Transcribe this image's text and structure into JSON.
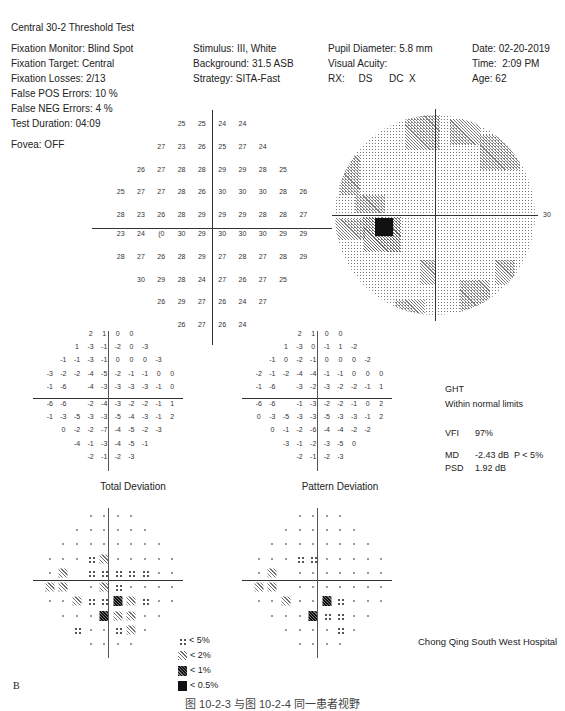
{
  "header": {
    "title": "Central 30-2 Threshold Test",
    "col1": [
      "Fixation Monitor: Blind Spot",
      "Fixation Target: Central",
      "Fixation Losses: 2/13",
      "False POS Errors:  10 %",
      "False NEG Errors:   4 %",
      "Test Duration: 04:09"
    ],
    "col2": [
      "Stimulus: III, White",
      "Background: 31.5 ASB",
      "Strategy: SITA-Fast"
    ],
    "col3": [
      "Pupil Diameter: 5.8 mm",
      "Visual Acuity:",
      "RX:     DS      DC  X"
    ],
    "col4": [
      "Date: 02-20-2019",
      "Time:  2:09 PM",
      "Age: 62"
    ],
    "fovea": "Fovea: OFF"
  },
  "threshold_plot": {
    "axis_label_left": "30",
    "axis_label_right": "30",
    "rows": [
      [
        "",
        "",
        "",
        "25",
        "25",
        "24",
        "24",
        "",
        "",
        ""
      ],
      [
        "",
        "",
        "27",
        "23",
        "26",
        "25",
        "27",
        "24",
        "",
        ""
      ],
      [
        "",
        "26",
        "27",
        "28",
        "28",
        "29",
        "29",
        "28",
        "25",
        ""
      ],
      [
        "25",
        "27",
        "27",
        "28",
        "26",
        "30",
        "30",
        "30",
        "28",
        "26"
      ],
      [
        "28",
        "23",
        "26",
        "28",
        "29",
        "29",
        "29",
        "28",
        "28",
        "27"
      ],
      [
        "23",
        "24",
        "(0",
        "30",
        "29",
        "30",
        "30",
        "30",
        "29",
        "29"
      ],
      [
        "28",
        "27",
        "26",
        "28",
        "29",
        "27",
        "28",
        "27",
        "28",
        "29"
      ],
      [
        "",
        "30",
        "29",
        "28",
        "24",
        "27",
        "26",
        "27",
        "25",
        ""
      ],
      [
        "",
        "",
        "26",
        "29",
        "27",
        "26",
        "24",
        "27",
        "",
        ""
      ],
      [
        "",
        "",
        "",
        "26",
        "27",
        "26",
        "24",
        "",
        "",
        ""
      ]
    ]
  },
  "total_deviation": {
    "title": "Total Deviation",
    "rows": [
      [
        "",
        "",
        "",
        "2",
        "1",
        "0",
        "0",
        "",
        "",
        ""
      ],
      [
        "",
        "",
        "1",
        "-3",
        "-1",
        "-2",
        "0",
        "-3",
        "",
        ""
      ],
      [
        "",
        "-1",
        "-1",
        "-3",
        "-1",
        "0",
        "0",
        "0",
        "-3",
        ""
      ],
      [
        "-3",
        "-2",
        "-2",
        "-4",
        "-5",
        "-2",
        "-1",
        "-1",
        "0",
        "0"
      ],
      [
        "-1",
        "-6",
        "",
        "-4",
        "-3",
        "-3",
        "-3",
        "-3",
        "-1",
        "0"
      ],
      [
        "-6",
        "-6",
        "",
        "-2",
        "-4",
        "-3",
        "-2",
        "-2",
        "-1",
        "1"
      ],
      [
        "-1",
        "-3",
        "-5",
        "-3",
        "-3",
        "-5",
        "-4",
        "-3",
        "-1",
        "2"
      ],
      [
        "",
        "0",
        "-2",
        "-2",
        "-7",
        "-4",
        "-5",
        "-2",
        "-3",
        ""
      ],
      [
        "",
        "",
        "-4",
        "-1",
        "-3",
        "-4",
        "-5",
        "-1",
        "",
        ""
      ],
      [
        "",
        "",
        "",
        "-2",
        "-1",
        "-2",
        "-3",
        "",
        "",
        ""
      ]
    ],
    "prob_rows": [
      [
        "",
        "",
        "",
        "dot",
        "dot",
        "dot",
        "dot",
        "",
        "",
        ""
      ],
      [
        "",
        "",
        "dot",
        "dot",
        "dot",
        "dot",
        "dot",
        "dot",
        "",
        ""
      ],
      [
        "",
        "dot",
        "dot",
        "dot",
        "dot",
        "dot",
        "dot",
        "dot",
        "dot",
        ""
      ],
      [
        "dot",
        "dot",
        "dot",
        "p5",
        "p2",
        "dot",
        "dot",
        "dot",
        "dot",
        "dot"
      ],
      [
        "dot",
        "p2",
        "",
        "p5",
        "p5",
        "p5",
        "p5",
        "p5",
        "dot",
        "dot"
      ],
      [
        "p2",
        "p2",
        "",
        "dot",
        "p2",
        "p5",
        "dot",
        "dot",
        "dot",
        "dot"
      ],
      [
        "dot",
        "dot",
        "p2",
        "p5",
        "p5",
        "p1",
        "p2",
        "p5",
        "dot",
        "dot"
      ],
      [
        "",
        "dot",
        "dot",
        "dot",
        "p1",
        "p2",
        "p2",
        "dot",
        "dot",
        ""
      ],
      [
        "",
        "",
        "p5",
        "dot",
        "dot",
        "p5",
        "p2",
        "dot",
        "",
        ""
      ],
      [
        "",
        "",
        "",
        "dot",
        "dot",
        "dot",
        "dot",
        "",
        "",
        ""
      ]
    ]
  },
  "pattern_deviation": {
    "title": "Pattern Deviation",
    "rows": [
      [
        "",
        "",
        "",
        "2",
        "1",
        "0",
        "0",
        "",
        "",
        ""
      ],
      [
        "",
        "",
        "1",
        "-3",
        "0",
        "-1",
        "1",
        "-2",
        "",
        ""
      ],
      [
        "",
        "-1",
        "0",
        "-2",
        "-1",
        "0",
        "0",
        "0",
        "-2",
        ""
      ],
      [
        "-2",
        "-1",
        "-2",
        "-4",
        "-4",
        "-1",
        "-1",
        "0",
        "0",
        "0"
      ],
      [
        "-1",
        "-6",
        "",
        "-3",
        "-2",
        "-3",
        "-2",
        "-2",
        "-1",
        "1"
      ],
      [
        "-6",
        "-6",
        "",
        "-1",
        "-3",
        "-2",
        "-2",
        "-1",
        "0",
        "2"
      ],
      [
        "0",
        "-3",
        "-5",
        "-3",
        "-3",
        "-5",
        "-3",
        "-3",
        "-1",
        "2"
      ],
      [
        "",
        "0",
        "-1",
        "-2",
        "-6",
        "-4",
        "-4",
        "-2",
        "-2",
        ""
      ],
      [
        "",
        "",
        "-3",
        "-1",
        "-2",
        "-3",
        "-5",
        "0",
        "",
        ""
      ],
      [
        "",
        "",
        "",
        "-2",
        "-1",
        "-2",
        "-3",
        "",
        "",
        ""
      ]
    ],
    "prob_rows": [
      [
        "",
        "",
        "",
        "dot",
        "dot",
        "dot",
        "dot",
        "",
        "",
        ""
      ],
      [
        "",
        "",
        "dot",
        "dot",
        "dot",
        "dot",
        "dot",
        "dot",
        "",
        ""
      ],
      [
        "",
        "dot",
        "dot",
        "dot",
        "dot",
        "dot",
        "dot",
        "dot",
        "dot",
        ""
      ],
      [
        "dot",
        "dot",
        "dot",
        "p5",
        "p5",
        "dot",
        "dot",
        "dot",
        "dot",
        "dot"
      ],
      [
        "dot",
        "p2",
        "",
        "dot",
        "dot",
        "dot",
        "dot",
        "dot",
        "dot",
        "dot"
      ],
      [
        "p2",
        "p2",
        "",
        "dot",
        "dot",
        "dot",
        "dot",
        "dot",
        "dot",
        "dot"
      ],
      [
        "dot",
        "dot",
        "p2",
        "dot",
        "dot",
        "p1",
        "p5",
        "dot",
        "dot",
        "dot"
      ],
      [
        "",
        "dot",
        "dot",
        "dot",
        "p1",
        "p5",
        "p5",
        "dot",
        "dot",
        ""
      ],
      [
        "",
        "",
        "dot",
        "dot",
        "dot",
        "dot",
        "p5",
        "dot",
        "",
        ""
      ],
      [
        "",
        "",
        "",
        "dot",
        "dot",
        "dot",
        "dot",
        "",
        "",
        ""
      ]
    ]
  },
  "indices": {
    "ght_label": "GHT",
    "ght_value": "Within normal limits",
    "vfi_label": "VFI",
    "vfi_value": "97%",
    "md_label": "MD",
    "md_value": "-2.43 dB  P < 5%",
    "psd_label": "PSD",
    "psd_value": "1.92 dB"
  },
  "legend": [
    {
      "symbol": "p5",
      "label": "< 5%"
    },
    {
      "symbol": "p2",
      "label": "< 2%"
    },
    {
      "symbol": "p1",
      "label": "< 1%"
    },
    {
      "symbol": "p05",
      "label": "< 0.5%"
    }
  ],
  "grayscale": {
    "axis_label_right": "30"
  },
  "hospital": "Chong Qing South West Hospital",
  "figure_letter": "B",
  "caption": "图 10-2-3   与图 10-2-4 同一患者视野"
}
